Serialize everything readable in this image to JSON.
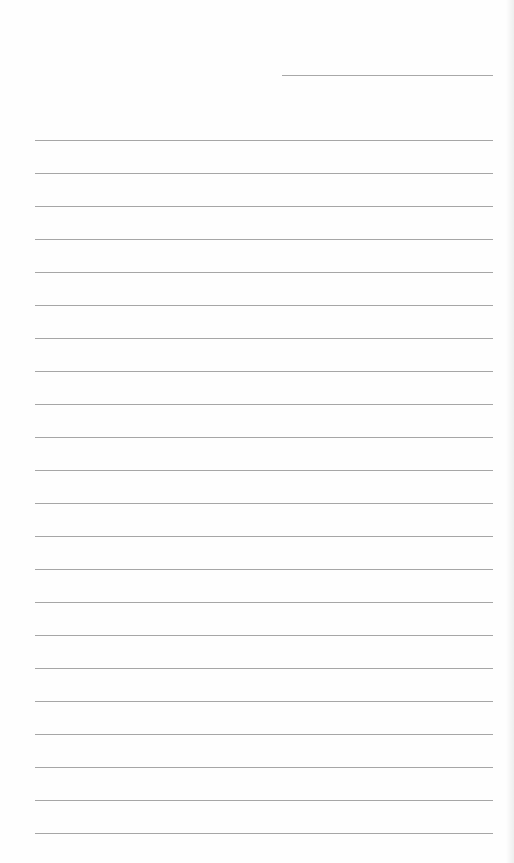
{
  "page": {
    "type": "lined-paper",
    "background_color": "#fefefe",
    "line_color": "#a6a6a6",
    "header_line": {
      "present": true
    },
    "ruled_lines": {
      "count": 22,
      "first_y": 140,
      "spacing": 33
    },
    "text_content": ""
  }
}
